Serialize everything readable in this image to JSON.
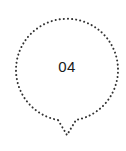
{
  "marker": {
    "label": "04",
    "stroke_color": "#333333",
    "background": "#ffffff",
    "style": "dotted"
  }
}
